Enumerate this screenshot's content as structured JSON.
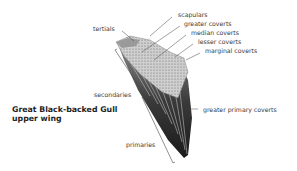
{
  "title": {
    "line1": "Great Black-backed Gull",
    "line2": "upper wing"
  },
  "labels": {
    "tertials": "tertials",
    "scapulars": "scapulars",
    "greater_coverts": "greater coverts",
    "median_coverts": "median coverts",
    "lesser_coverts": "lesser coverts",
    "marginal_coverts": "marginal coverts",
    "secondaries": "secondaries",
    "greater_primary_coverts": "greater primary coverts",
    "primaries": "primaries"
  }
}
